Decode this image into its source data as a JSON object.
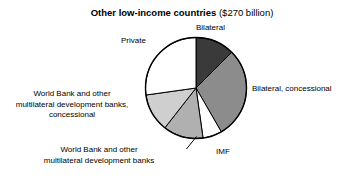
{
  "chart_data": {
    "type": "pie",
    "title_main": "Other low-income countries",
    "title_sub": "($270 billion)",
    "total_label": "$270 billion",
    "xlabel": "",
    "ylabel": "",
    "grid": false,
    "legend_position": "none",
    "labels_placement": "outside-callouts",
    "start_angle_deg": 0,
    "direction": "clockwise",
    "categories": [
      "Bilateral",
      "Bilateral, concessional",
      "IMF",
      "World Bank and other multilateral development banks",
      "World Bank and other multilateral development banks, concessional",
      "Private"
    ],
    "values": [
      12.5,
      29.2,
      6.1,
      12.8,
      12.2,
      27.2
    ],
    "value_units": "percent",
    "slices": [
      {
        "label": "Bilateral",
        "percent": 12.5,
        "start_deg": 0,
        "end_deg": 45,
        "color": "#3a3a3a"
      },
      {
        "label": "Bilateral, concessional",
        "percent": 29.2,
        "start_deg": 45,
        "end_deg": 150,
        "color": "#8c8c8c"
      },
      {
        "label": "IMF",
        "percent": 6.1,
        "start_deg": 150,
        "end_deg": 172,
        "color": "#ffffff"
      },
      {
        "label": "World Bank and other multilateral development banks",
        "percent": 12.8,
        "start_deg": 172,
        "end_deg": 218,
        "color": "#b0b0b0"
      },
      {
        "label": "World Bank and other multilateral development banks, concessional",
        "percent": 12.2,
        "start_deg": 218,
        "end_deg": 262,
        "color": "#cfcfcf"
      },
      {
        "label": "Private",
        "percent": 27.2,
        "start_deg": 262,
        "end_deg": 360,
        "color": "#ffffff"
      }
    ]
  },
  "labels": {
    "bilateral": "Bilateral",
    "bilateral_concessional": "Bilateral, concessional",
    "imf": "IMF",
    "wb_mdb_line1": "World Bank and other",
    "wb_mdb_line2": "multilateral development banks",
    "wb_mdb_concessional_line1": "World Bank and other",
    "wb_mdb_concessional_line2": "multilateral development banks,",
    "wb_mdb_concessional_line3": "concessional",
    "private": "Private"
  },
  "colors": {
    "outline": "#000000",
    "background": "#ffffff",
    "bilateral": "#3a3a3a",
    "bilateral_concessional": "#8c8c8c",
    "imf": "#ffffff",
    "wb_mdb": "#b0b0b0",
    "wb_mdb_concessional": "#cfcfcf",
    "private": "#ffffff"
  }
}
